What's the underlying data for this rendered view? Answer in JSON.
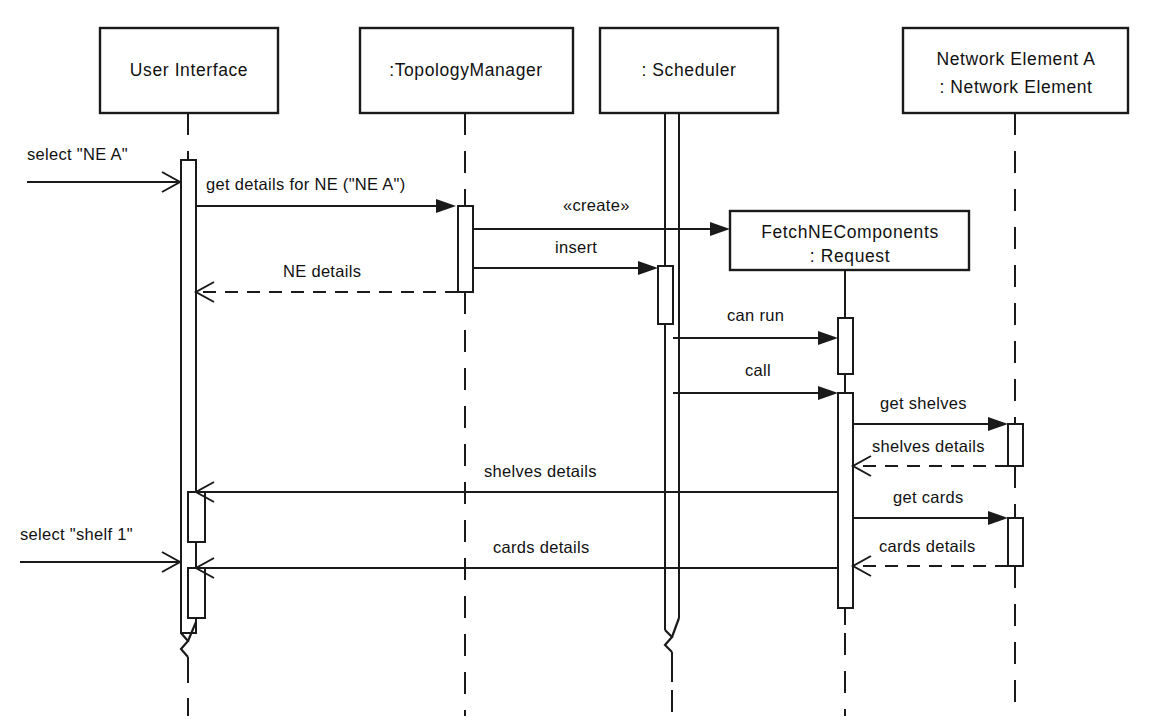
{
  "diagram": {
    "kind": "uml-sequence-diagram",
    "title": "",
    "background_color": "#ffffff",
    "line_color": "#1a1a1a",
    "text_color": "#111111"
  },
  "participants": [
    {
      "id": "user-interface",
      "label": "User Interface",
      "lines": [
        "User Interface"
      ],
      "lifeline_style": "dashed",
      "active_object": false
    },
    {
      "id": "topology-manager",
      "label": ":TopologyManager",
      "lines": [
        ":TopologyManager"
      ],
      "lifeline_style": "dashed",
      "active_object": false
    },
    {
      "id": "scheduler",
      "label": ": Scheduler",
      "lines": [
        ": Scheduler"
      ],
      "lifeline_style": "dashed",
      "active_object": true
    },
    {
      "id": "network-element-a",
      "label": "Network Element A : Network Element",
      "lines": [
        "Network Element A",
        ": Network Element"
      ],
      "lifeline_style": "dashed",
      "active_object": false
    },
    {
      "id": "fetch-ne-components",
      "label": "FetchNEComponents : Request",
      "lines": [
        "FetchNEComponents",
        ": Request"
      ],
      "lifeline_style": "dashed",
      "active_object": false,
      "created_during_sequence": true
    }
  ],
  "messages": [
    {
      "id": "select-ne-a",
      "label": "select \"NE A\"",
      "from": "found",
      "to": "user-interface",
      "line": "solid",
      "arrow": "open",
      "kind": "found-message"
    },
    {
      "id": "get-details-for-ne",
      "label": "get details for NE (\"NE A\")",
      "from": "user-interface",
      "to": "topology-manager",
      "line": "solid",
      "arrow": "filled",
      "kind": "call"
    },
    {
      "id": "create-request",
      "label": "«create»",
      "from": "topology-manager",
      "to": "fetch-ne-components",
      "line": "solid",
      "arrow": "filled",
      "kind": "create"
    },
    {
      "id": "insert",
      "label": "insert",
      "from": "topology-manager",
      "to": "scheduler",
      "line": "solid",
      "arrow": "filled",
      "kind": "call"
    },
    {
      "id": "ne-details",
      "label": "NE details",
      "from": "topology-manager",
      "to": "user-interface",
      "line": "dashed",
      "arrow": "open",
      "kind": "return"
    },
    {
      "id": "can-run",
      "label": "can run",
      "from": "scheduler",
      "to": "fetch-ne-components",
      "line": "solid",
      "arrow": "filled",
      "kind": "call"
    },
    {
      "id": "call",
      "label": "call",
      "from": "scheduler",
      "to": "fetch-ne-components",
      "line": "solid",
      "arrow": "filled",
      "kind": "call"
    },
    {
      "id": "get-shelves",
      "label": "get shelves",
      "from": "fetch-ne-components",
      "to": "network-element-a",
      "line": "solid",
      "arrow": "filled",
      "kind": "call"
    },
    {
      "id": "shelves-details-ne",
      "label": "shelves details",
      "from": "network-element-a",
      "to": "fetch-ne-components",
      "line": "dashed",
      "arrow": "open",
      "kind": "return"
    },
    {
      "id": "shelves-details-ui",
      "label": "shelves details",
      "from": "fetch-ne-components",
      "to": "user-interface",
      "line": "solid",
      "arrow": "open",
      "kind": "call"
    },
    {
      "id": "get-cards",
      "label": "get cards",
      "from": "fetch-ne-components",
      "to": "network-element-a",
      "line": "solid",
      "arrow": "filled",
      "kind": "call"
    },
    {
      "id": "cards-details-ne",
      "label": "cards details",
      "from": "network-element-a",
      "to": "fetch-ne-components",
      "line": "dashed",
      "arrow": "open",
      "kind": "return"
    },
    {
      "id": "select-shelf-1",
      "label": "select \"shelf 1\"",
      "from": "found",
      "to": "user-interface",
      "line": "solid",
      "arrow": "open",
      "kind": "found-message"
    },
    {
      "id": "cards-details-ui",
      "label": "cards details",
      "from": "fetch-ne-components",
      "to": "user-interface",
      "line": "solid",
      "arrow": "open",
      "kind": "call"
    }
  ]
}
